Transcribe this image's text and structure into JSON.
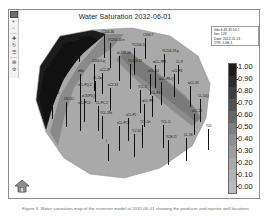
{
  "app": {
    "title": "Water Saturation 2032-06-01"
  },
  "toolbar": {
    "name": "map-view-toolbar",
    "buttons": [
      {
        "name": "pointer-select-icon",
        "glyph": "■"
      },
      {
        "name": "zoom-in-icon",
        "glyph": "⌖"
      },
      {
        "name": "zoom-out-icon",
        "glyph": "▫"
      },
      {
        "name": "pan-hand-icon",
        "glyph": "✚"
      },
      {
        "name": "rotate-icon",
        "glyph": "↻"
      },
      {
        "name": "layers-icon",
        "glyph": "☰"
      },
      {
        "name": "grid-toggle-icon",
        "glyph": "⊞"
      },
      {
        "name": "settings-icon",
        "glyph": "⚙"
      }
    ]
  },
  "info_box": {
    "lines": [
      "Info 6:45 32:10.1",
      "Iter:  123",
      "Date: 2012-11-13",
      "2TR: 1.0E-1"
    ]
  },
  "home_button": {
    "label": "home-view",
    "tooltip": "Reset view"
  },
  "caption": {
    "text": "Figure 5.  Water saturation map of the reservoir model at 2032-06-01 showing the producer and injector well locations."
  },
  "chart_data": {
    "type": "heatmap",
    "title": "Water Saturation 2032-06-01",
    "xlabel": "",
    "ylabel": "",
    "grid": false,
    "legend_position": "right",
    "colorbar": {
      "label": "Water Saturation",
      "vmin": 0.0,
      "vmax": 1.0,
      "ticks": [
        "1.00",
        "0.90",
        "0.80",
        "0.70",
        "0.60",
        "0.50",
        "0.40",
        "0.30",
        "0.20",
        "0.10",
        "0.00"
      ],
      "tick_values": [
        1.0,
        0.9,
        0.8,
        0.7,
        0.6,
        0.5,
        0.4,
        0.3,
        0.2,
        0.1,
        0.0
      ],
      "colormap": "grayscale",
      "colors": [
        "#1c1c1c",
        "#2d2d2d",
        "#3f3f3f",
        "#525252",
        "#686868",
        "#7e7e7e",
        "#8f8f8f",
        "#9d9d9d",
        "#a9a9a9",
        "#b2b2b2",
        "#bcbcbc"
      ]
    },
    "regions": [
      {
        "name": "high-saturation-flood-front",
        "value": 1.0,
        "color": "#1c1c1c",
        "location": "northwest"
      },
      {
        "name": "mid-saturation-channel",
        "value": 0.6,
        "color": "#7e7e7e",
        "location": "center-diagonal"
      },
      {
        "name": "low-saturation-body",
        "value": 0.2,
        "color": "#a9a9a9",
        "location": "main-reservoir"
      }
    ],
    "wells": [
      {
        "label": "C204-36",
        "x": 82,
        "y": 9,
        "depth": 22
      },
      {
        "label": "C204-8",
        "x": 57,
        "y": 15,
        "depth": 20
      },
      {
        "label": "C204-9",
        "x": 42,
        "y": 21,
        "depth": 18
      },
      {
        "label": "YC204-10 n",
        "x": 88,
        "y": 17,
        "depth": 24
      },
      {
        "label": "C204-7",
        "x": 123,
        "y": 12,
        "depth": 20
      },
      {
        "label": "YC204-11",
        "x": 112,
        "y": 22,
        "depth": 26
      },
      {
        "label": "xC204-30",
        "x": 97,
        "y": 30,
        "depth": 24
      },
      {
        "label": "YC204-19 g",
        "x": 142,
        "y": 28,
        "depth": 22
      },
      {
        "label": "C204-5 g",
        "x": 72,
        "y": 38,
        "depth": 26
      },
      {
        "label": "YC204-12",
        "x": 108,
        "y": 38,
        "depth": 24
      },
      {
        "label": "wCL-7PR",
        "x": 133,
        "y": 39,
        "depth": 22
      },
      {
        "label": "CL-9",
        "x": 156,
        "y": 39,
        "depth": 18
      },
      {
        "label": "m6x",
        "x": 58,
        "y": 48,
        "depth": 14
      },
      {
        "label": "xC2-2P",
        "x": 80,
        "y": 47,
        "depth": 20
      },
      {
        "label": "wCL-54",
        "x": 128,
        "y": 48,
        "depth": 20
      },
      {
        "label": "xCL-P4",
        "x": 152,
        "y": 48,
        "depth": 22
      },
      {
        "label": "CL-2q",
        "x": 73,
        "y": 55,
        "depth": 20
      },
      {
        "label": "wCL-P8-Q",
        "x": 139,
        "y": 56,
        "depth": 22
      },
      {
        "label": "xCL-PQ-2",
        "x": 58,
        "y": 62,
        "depth": 22
      },
      {
        "label": "xC2-33",
        "x": 88,
        "y": 62,
        "depth": 22
      },
      {
        "label": "wCL-35",
        "x": 168,
        "y": 60,
        "depth": 20
      },
      {
        "label": "YCL-2",
        "x": 118,
        "y": 64,
        "depth": 22
      },
      {
        "label": "xCL-P4",
        "x": 130,
        "y": 70,
        "depth": 20
      },
      {
        "label": "XP204-",
        "x": 30,
        "y": 70,
        "depth": 22
      },
      {
        "label": "C8-11C",
        "x": 44,
        "y": 76,
        "depth": 24
      },
      {
        "label": "xC8-P1Q",
        "x": 62,
        "y": 73,
        "depth": 22
      },
      {
        "label": "CL-54Q",
        "x": 178,
        "y": 73,
        "depth": 22
      },
      {
        "label": "xCL-PC4",
        "x": 58,
        "y": 80,
        "depth": 24
      },
      {
        "label": "CL-PC-2",
        "x": 76,
        "y": 80,
        "depth": 24
      },
      {
        "label": "wCL-PR",
        "x": 122,
        "y": 78,
        "depth": 22
      },
      {
        "label": "YCL-19x",
        "x": 80,
        "y": 90,
        "depth": 22
      },
      {
        "label": "xCL-P2",
        "x": 106,
        "y": 92,
        "depth": 22
      },
      {
        "label": "xCL-2K",
        "x": 172,
        "y": 88,
        "depth": 20
      },
      {
        "label": "xCL-PC2",
        "x": 97,
        "y": 100,
        "depth": 24
      },
      {
        "label": "YCL-5n",
        "x": 120,
        "y": 99,
        "depth": 22
      },
      {
        "label": "YCL-2i",
        "x": 141,
        "y": 99,
        "depth": 22
      },
      {
        "label": "Y-2-10",
        "x": 112,
        "y": 108,
        "depth": 22
      },
      {
        "label": "Y02-",
        "x": 186,
        "y": 103,
        "depth": 20
      },
      {
        "label": "YCB-11",
        "x": 146,
        "y": 114,
        "depth": 24
      },
      {
        "label": "CL-1K",
        "x": 164,
        "y": 112,
        "depth": 22
      },
      {
        "label": "I",
        "x": 86,
        "y": 118,
        "depth": 16
      }
    ]
  }
}
